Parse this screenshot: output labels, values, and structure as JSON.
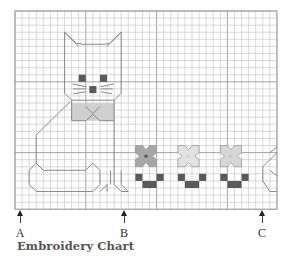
{
  "title": "Embroidery Chart",
  "grid": {
    "left": 15,
    "top": 11,
    "cols": 37,
    "rows": 28,
    "cell": 7.08,
    "line_color": "#c9c9c9",
    "major_color": "#9a9a9a",
    "border_color": "#a0a0a0"
  },
  "colors": {
    "outline": "#8a8a8a",
    "dark": "#5a5a5a",
    "mid": "#a6a6a6",
    "light_bow": "#cfcfcf",
    "flower2": "#e2e2e2",
    "flower3": "#d6d6d6"
  },
  "markers": [
    {
      "label": "A",
      "x": 20
    },
    {
      "label": "B",
      "x": 124
    },
    {
      "label": "C",
      "x": 262
    }
  ]
}
